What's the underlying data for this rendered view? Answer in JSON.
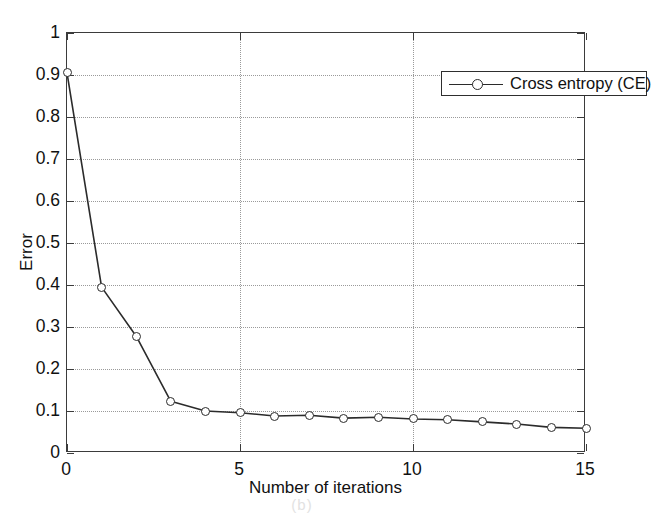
{
  "figure": {
    "background": "#ffffff",
    "axis_color": "#3b3b3b",
    "grid_color": "#9a9a9a",
    "series_color": "#2b2b2b",
    "faint_caption": "(b)"
  },
  "chart_data": {
    "type": "line",
    "title": "",
    "xlabel": "Number of iterations",
    "ylabel": "Error",
    "xlim": [
      0,
      15
    ],
    "ylim": [
      0,
      1
    ],
    "grid": true,
    "legend_position": "top-right",
    "xticks": [
      0,
      5,
      10,
      15
    ],
    "xtick_labels": [
      "0",
      "5",
      "10",
      "15"
    ],
    "yticks": [
      0,
      0.1,
      0.2,
      0.3,
      0.4,
      0.5,
      0.6,
      0.7,
      0.8,
      0.9,
      1
    ],
    "ytick_labels": [
      "0",
      "0.1",
      "0.2",
      "0.3",
      "0.4",
      "0.5",
      "0.6",
      "0.7",
      "0.8",
      "0.9",
      "1"
    ],
    "series": [
      {
        "name": "Cross entropy (CE)",
        "marker": "circle-open",
        "line_style": "solid",
        "color": "#2b2b2b",
        "x": [
          0,
          1,
          2,
          3,
          4,
          5,
          6,
          7,
          8,
          9,
          10,
          11,
          12,
          13,
          14,
          15
        ],
        "values": [
          0.905,
          0.395,
          0.278,
          0.123,
          0.1,
          0.096,
          0.088,
          0.09,
          0.083,
          0.085,
          0.081,
          0.079,
          0.074,
          0.069,
          0.061,
          0.059
        ]
      }
    ]
  },
  "legend": {
    "entries": [
      {
        "label": "Cross entropy (CE)"
      }
    ]
  }
}
